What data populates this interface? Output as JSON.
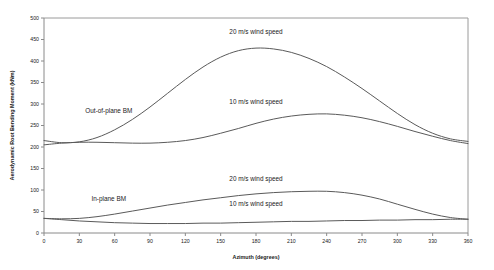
{
  "chart_data": {
    "type": "line",
    "title": "",
    "xlabel": "Azimuth (degrees)",
    "ylabel": "Aerodynamic Root Bending Moment (kNm)",
    "xlim": [
      0,
      360
    ],
    "ylim": [
      0,
      500
    ],
    "xticks": [
      0,
      30,
      60,
      90,
      120,
      150,
      180,
      210,
      240,
      270,
      300,
      330,
      360
    ],
    "yticks": [
      0,
      50,
      100,
      150,
      200,
      250,
      300,
      350,
      400,
      450,
      500
    ],
    "xtick_labels": [
      "0",
      "30",
      "60",
      "90",
      "120",
      "150",
      "180",
      "210",
      "240",
      "270",
      "300",
      "330",
      "360"
    ],
    "ytick_labels": [
      "0",
      "50",
      "100",
      "150",
      "200",
      "250",
      "300",
      "350",
      "400",
      "450",
      "500"
    ],
    "grid": false,
    "legend": "none",
    "line_color": "#5a5a5a",
    "x": [
      0,
      15,
      30,
      45,
      60,
      75,
      90,
      105,
      120,
      135,
      150,
      165,
      180,
      195,
      210,
      225,
      240,
      255,
      270,
      285,
      300,
      315,
      330,
      345,
      360
    ],
    "series": [
      {
        "name": "Out-of-plane BM, 20 m/s wind speed",
        "group": "Out-of-plane BM",
        "wind_speed": "20 m/s",
        "values": [
          215,
          210,
          212,
          222,
          240,
          264,
          293,
          325,
          357,
          386,
          409,
          424,
          430,
          428,
          420,
          406,
          387,
          363,
          336,
          307,
          278,
          252,
          232,
          219,
          213
        ]
      },
      {
        "name": "Out-of-plane BM, 10 m/s wind speed",
        "group": "Out-of-plane BM",
        "wind_speed": "10 m/s",
        "values": [
          205,
          209,
          211,
          211,
          210,
          209,
          209,
          211,
          215,
          222,
          232,
          243,
          255,
          265,
          272,
          276,
          277,
          274,
          268,
          259,
          248,
          236,
          225,
          215,
          208
        ]
      },
      {
        "name": "In-plane BM, 20 m/s wind speed",
        "group": "In-plane BM",
        "wind_speed": "20 m/s",
        "values": [
          34,
          33,
          34,
          38,
          44,
          51,
          58,
          65,
          71,
          77,
          82,
          87,
          91,
          94,
          96,
          97,
          97,
          94,
          88,
          79,
          67,
          55,
          44,
          36,
          32
        ]
      },
      {
        "name": "In-plane BM, 10 m/s wind speed",
        "group": "In-plane BM",
        "wind_speed": "10 m/s",
        "values": [
          34,
          31,
          28,
          26,
          24,
          23,
          22,
          22,
          22,
          23,
          23,
          24,
          25,
          26,
          27,
          27,
          28,
          29,
          29,
          30,
          30,
          31,
          31,
          32,
          32
        ]
      }
    ],
    "annotations": [
      {
        "id": "out-of-plane-bm-label",
        "text": "Out-of-plane BM",
        "x": 55,
        "y": 280
      },
      {
        "id": "in-plane-bm-label",
        "text": "In-plane BM",
        "x": 55,
        "y": 75
      },
      {
        "id": "oop-20ms-label",
        "text": "20 m/s wind speed",
        "x": 180,
        "y": 462
      },
      {
        "id": "oop-10ms-label",
        "text": "10 m/s wind speed",
        "x": 180,
        "y": 300
      },
      {
        "id": "ip-20ms-label",
        "text": "20 m/s wind speed",
        "x": 180,
        "y": 120
      },
      {
        "id": "ip-10ms-label",
        "text": "10 m/s wind speed",
        "x": 180,
        "y": 62
      }
    ]
  }
}
